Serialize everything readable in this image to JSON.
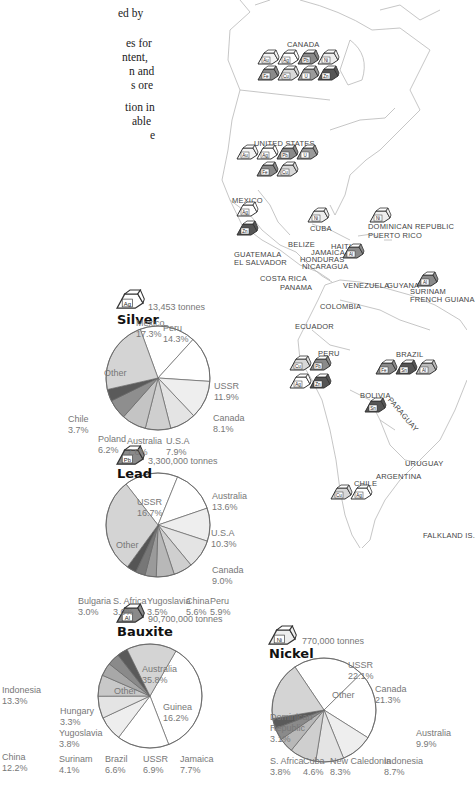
{
  "intro_fragments": [
    "ed by",
    "es for",
    "ntent,",
    "n and",
    "s ore",
    "tion in",
    "able",
    "e"
  ],
  "map": {
    "country_labels": [
      {
        "id": "canada",
        "text": "CANADA",
        "x": 287,
        "y": 40
      },
      {
        "id": "us",
        "text": "UNITED STATES",
        "x": 254,
        "y": 139
      },
      {
        "id": "mexico",
        "text": "MEXICO",
        "x": 232,
        "y": 196
      },
      {
        "id": "cuba",
        "text": "CUBA",
        "x": 310,
        "y": 224
      },
      {
        "id": "dominican",
        "text": "DOMINICAN REPUBLIC",
        "x": 368,
        "y": 224
      },
      {
        "id": "puertorico",
        "text": "PUERTO RICO",
        "x": 368,
        "y": 232
      },
      {
        "id": "belize",
        "text": "BELIZE",
        "x": 288,
        "y": 241
      },
      {
        "id": "haiti",
        "text": "HAITI",
        "x": 331,
        "y": 245
      },
      {
        "id": "jamaica",
        "text": "JAMAICA",
        "x": 311,
        "y": 247
      },
      {
        "id": "honduras",
        "text": "HONDURAS",
        "x": 301,
        "y": 254
      },
      {
        "id": "guatemala",
        "text": "GUATEMALA",
        "x": 234,
        "y": 250
      },
      {
        "id": "elsalvador",
        "text": "EL SALVADOR",
        "x": 234,
        "y": 257
      },
      {
        "id": "nicaragua",
        "text": "NICARAGUA",
        "x": 302,
        "y": 261
      },
      {
        "id": "costarica",
        "text": "COSTA RICA",
        "x": 260,
        "y": 276
      },
      {
        "id": "panama",
        "text": "PANAMA",
        "x": 280,
        "y": 284
      },
      {
        "id": "venezuela",
        "text": "VENEZUELA",
        "x": 345,
        "y": 284
      },
      {
        "id": "guyana",
        "text": "GUYANA",
        "x": 388,
        "y": 284
      },
      {
        "id": "suriname",
        "text": "SURINAM",
        "x": 410,
        "y": 290
      },
      {
        "id": "frenchguiana",
        "text": "FRENCH GUIANA",
        "x": 410,
        "y": 298
      },
      {
        "id": "colombia",
        "text": "COLOMBIA",
        "x": 322,
        "y": 302
      },
      {
        "id": "ecuador",
        "text": "ECUADOR",
        "x": 296,
        "y": 324
      },
      {
        "id": "peru",
        "text": "PERU",
        "x": 318,
        "y": 350
      },
      {
        "id": "brazil",
        "text": "BRAZIL",
        "x": 396,
        "y": 354
      },
      {
        "id": "bolivia",
        "text": "BOLIVIA",
        "x": 360,
        "y": 392
      },
      {
        "id": "paraguay",
        "text": "PARAGUAY",
        "x": 384,
        "y": 410
      },
      {
        "id": "uruguay",
        "text": "URUGUAY",
        "x": 405,
        "y": 460
      },
      {
        "id": "argentina",
        "text": "ARGENTINA",
        "x": 376,
        "y": 472
      },
      {
        "id": "chile",
        "text": "CHILE",
        "x": 354,
        "y": 479
      },
      {
        "id": "falkland",
        "text": "FALKLAND IS.",
        "x": 423,
        "y": 532
      }
    ],
    "mineral_blocks": [
      {
        "country": "Canada",
        "symbol": "Au",
        "shade": "#f4f4f4",
        "x": 258,
        "y": 50
      },
      {
        "country": "Canada",
        "symbol": "Ag",
        "shade": "#ffffff",
        "x": 278,
        "y": 50
      },
      {
        "country": "Canada",
        "symbol": "Pb",
        "shade": "#8a8a8a",
        "x": 298,
        "y": 50
      },
      {
        "country": "Canada",
        "symbol": "Ni",
        "shade": "#eeeeee",
        "x": 318,
        "y": 50
      },
      {
        "country": "Canada",
        "symbol": "Fe",
        "shade": "#8a8a8a",
        "x": 258,
        "y": 66
      },
      {
        "country": "Canada",
        "symbol": "Cu",
        "shade": "#d8d8d8",
        "x": 278,
        "y": 66
      },
      {
        "country": "Canada",
        "symbol": "U",
        "shade": "#9a9a9a",
        "x": 298,
        "y": 66
      },
      {
        "country": "Canada",
        "symbol": "Zn",
        "shade": "#555555",
        "x": 318,
        "y": 66
      },
      {
        "country": "United States",
        "symbol": "Au",
        "shade": "#f4f4f4",
        "x": 237,
        "y": 145
      },
      {
        "country": "United States",
        "symbol": "Ag",
        "shade": "#ffffff",
        "x": 257,
        "y": 145
      },
      {
        "country": "United States",
        "symbol": "Pb",
        "shade": "#8a8a8a",
        "x": 277,
        "y": 145
      },
      {
        "country": "United States",
        "symbol": "U",
        "shade": "#9a9a9a",
        "x": 297,
        "y": 145
      },
      {
        "country": "United States",
        "symbol": "Fe",
        "shade": "#8a8a8a",
        "x": 257,
        "y": 162
      },
      {
        "country": "United States",
        "symbol": "Cu",
        "shade": "#d8d8d8",
        "x": 277,
        "y": 162
      },
      {
        "country": "Mexico",
        "symbol": "Ag",
        "shade": "#ffffff",
        "x": 237,
        "y": 202
      },
      {
        "country": "Mexico",
        "symbol": "Zn",
        "shade": "#555555",
        "x": 237,
        "y": 221
      },
      {
        "country": "Cuba",
        "symbol": "Ni",
        "shade": "#eeeeee",
        "x": 308,
        "y": 208
      },
      {
        "country": "Dominican Republic",
        "symbol": "Ni",
        "shade": "#eeeeee",
        "x": 370,
        "y": 208
      },
      {
        "country": "Jamaica",
        "symbol": "Al",
        "shade": "#8a8a8a",
        "x": 343,
        "y": 244
      },
      {
        "country": "Surinam",
        "symbol": "Al",
        "shade": "#8a8a8a",
        "x": 417,
        "y": 272
      },
      {
        "country": "Peru",
        "symbol": "Cu",
        "shade": "#d8d8d8",
        "x": 290,
        "y": 356
      },
      {
        "country": "Peru",
        "symbol": "Pb",
        "shade": "#8a8a8a",
        "x": 310,
        "y": 356
      },
      {
        "country": "Peru",
        "symbol": "Ag",
        "shade": "#ffffff",
        "x": 290,
        "y": 374
      },
      {
        "country": "Peru",
        "symbol": "Zn",
        "shade": "#555555",
        "x": 310,
        "y": 374
      },
      {
        "country": "Brazil",
        "symbol": "Fe",
        "shade": "#8a8a8a",
        "x": 376,
        "y": 360
      },
      {
        "country": "Brazil",
        "symbol": "Sn",
        "shade": "#555555",
        "x": 396,
        "y": 360
      },
      {
        "country": "Brazil",
        "symbol": "Al",
        "shade": "#bbbbbb",
        "x": 416,
        "y": 360
      },
      {
        "country": "Bolivia",
        "symbol": "Sn",
        "shade": "#555555",
        "x": 365,
        "y": 398
      },
      {
        "country": "Chile",
        "symbol": "Cu",
        "shade": "#d8d8d8",
        "x": 331,
        "y": 485
      },
      {
        "country": "Chile",
        "symbol": "Ag",
        "shade": "#ffffff",
        "x": 351,
        "y": 485
      }
    ]
  },
  "chart_data": [
    {
      "type": "pie",
      "title": "Silver",
      "symbol": "Ag",
      "subtitle": "13,453 tonnes",
      "categories": [
        "Mexico",
        "Peru",
        "USSR",
        "Canada",
        "U.S.A",
        "Australia",
        "Poland",
        "Chile",
        "Other"
      ],
      "values": [
        17.3,
        14.3,
        11.9,
        8.1,
        7.9,
        7.6,
        6.2,
        3.7,
        23.0
      ],
      "labels": [
        "17.3%",
        "14.3%",
        "11.9%",
        "8.1%",
        "7.9%",
        "7.6%",
        "6.2%",
        "3.7%",
        ""
      ]
    },
    {
      "type": "pie",
      "title": "Lead",
      "symbol": "Pb",
      "subtitle": "3,300,000 tonnes",
      "categories": [
        "USSR",
        "Australia",
        "U.S.A",
        "Canada",
        "Peru",
        "China",
        "Yugoslavia",
        "S. Africa",
        "Bulgaria",
        "Other"
      ],
      "values": [
        16.7,
        13.6,
        10.3,
        9.0,
        5.9,
        5.6,
        3.5,
        3.0,
        3.0,
        29.4
      ],
      "labels": [
        "16.7%",
        "13.6%",
        "10.3%",
        "9.0%",
        "5.9%",
        "5.6%",
        "3.5%",
        "3.0%",
        "3.0%",
        ""
      ]
    },
    {
      "type": "pie",
      "title": "Bauxite",
      "symbol": "Al",
      "subtitle": "90,700,000 tonnes",
      "categories": [
        "Australia",
        "Guinea",
        "Jamaica",
        "USSR",
        "Brazil",
        "Surinam",
        "Yugoslavia",
        "Hungary",
        "Other"
      ],
      "values": [
        35.8,
        16.2,
        7.7,
        6.9,
        6.6,
        4.1,
        3.8,
        3.3,
        15.6
      ],
      "labels": [
        "35.8%",
        "16.2%",
        "7.7%",
        "6.9%",
        "6.6%",
        "4.1%",
        "3.8%",
        "3.3%",
        ""
      ]
    },
    {
      "type": "pie",
      "title": "Nickel",
      "symbol": "Ni",
      "subtitle": "770,000 tonnes",
      "categories": [
        "USSR",
        "Canada",
        "Australia",
        "Indonesia",
        "New Caledonia",
        "Cuba",
        "S. Africa",
        "Dominican Republic",
        "Other"
      ],
      "values": [
        22.1,
        21.3,
        9.9,
        8.7,
        8.3,
        4.6,
        3.8,
        3.1,
        18.2
      ],
      "labels": [
        "22.1%",
        "21.3%",
        "9.9%",
        "8.7%",
        "8.3%",
        "4.6%",
        "3.8%",
        "3.1%",
        ""
      ]
    },
    {
      "type": "pie",
      "title": "(partial, cropped)",
      "categories": [
        "Indonesia",
        "China"
      ],
      "values": [
        13.3,
        12.2
      ],
      "labels": [
        "13.3%",
        "12.2%"
      ]
    }
  ],
  "pies": {
    "silver": {
      "title": "Silver",
      "symbol": "Ag",
      "tonnes": "13,453 tonnes",
      "labels": [
        {
          "text": "Mexico\n17.3%",
          "x": 136,
          "y": 318
        },
        {
          "text": "Peru\n14.3%",
          "x": 163,
          "y": 323
        },
        {
          "text": "USSR\n11.9%",
          "x": 214,
          "y": 381
        },
        {
          "text": "Canada\n8.1%",
          "x": 213,
          "y": 413
        },
        {
          "text": "U.S.A\n7.9%",
          "x": 166,
          "y": 436
        },
        {
          "text": "Australia\n7.6%",
          "x": 127,
          "y": 436
        },
        {
          "text": "Poland\n6.2%",
          "x": 98,
          "y": 434
        },
        {
          "text": "Chile\n3.7%",
          "x": 68,
          "y": 414
        },
        {
          "text": "Other",
          "x": 104,
          "y": 368
        }
      ]
    },
    "lead": {
      "title": "Lead",
      "symbol": "Pb",
      "tonnes": "3,300,000 tonnes",
      "labels": [
        {
          "text": "USSR\n16.7%",
          "x": 137,
          "y": 497
        },
        {
          "text": "Australia\n13.6%",
          "x": 212,
          "y": 491
        },
        {
          "text": "U.S.A\n10.3%",
          "x": 211,
          "y": 528
        },
        {
          "text": "Canada\n9.0%",
          "x": 212,
          "y": 565
        },
        {
          "text": "Peru\n5.9%",
          "x": 210,
          "y": 596
        },
        {
          "text": "China\n5.6%",
          "x": 186,
          "y": 596
        },
        {
          "text": "Yugoslavia\n3.5%",
          "x": 147,
          "y": 596
        },
        {
          "text": "S. Africa\n3.0%",
          "x": 113,
          "y": 596
        },
        {
          "text": "Bulgaria\n3.0%",
          "x": 78,
          "y": 596
        },
        {
          "text": "Other",
          "x": 116,
          "y": 540
        }
      ]
    },
    "bauxite": {
      "title": "Bauxite",
      "symbol": "Al",
      "tonnes": "90,700,000 tonnes",
      "labels": [
        {
          "text": "Australia\n35.8%",
          "x": 142,
          "y": 664
        },
        {
          "text": "Guinea\n16.2%",
          "x": 163,
          "y": 702
        },
        {
          "text": "Jamaica\n7.7%",
          "x": 180,
          "y": 754
        },
        {
          "text": "USSR\n6.9%",
          "x": 143,
          "y": 754
        },
        {
          "text": "Brazil\n6.6%",
          "x": 105,
          "y": 754
        },
        {
          "text": "Surinam\n4.1%",
          "x": 59,
          "y": 754
        },
        {
          "text": "Yugoslavia\n3.8%",
          "x": 59,
          "y": 728
        },
        {
          "text": "Hungary\n3.3%",
          "x": 60,
          "y": 706
        },
        {
          "text": "Other",
          "x": 114,
          "y": 686
        }
      ]
    },
    "nickel": {
      "title": "Nickel",
      "symbol": "Ni",
      "tonnes": "770,000 tonnes",
      "labels": [
        {
          "text": "USSR\n22.1%",
          "x": 348,
          "y": 660
        },
        {
          "text": "Canada\n21.3%",
          "x": 375,
          "y": 684
        },
        {
          "text": "Australia\n9.9%",
          "x": 416,
          "y": 728
        },
        {
          "text": "Indonesia\n8.7%",
          "x": 384,
          "y": 756
        },
        {
          "text": "New Caledonia\n8.3%",
          "x": 330,
          "y": 756
        },
        {
          "text": "Cuba\n4.6%",
          "x": 303,
          "y": 756
        },
        {
          "text": "S. Africa\n3.8%",
          "x": 270,
          "y": 756
        },
        {
          "text": "Dominican\nRepublic\n3.1%",
          "x": 270,
          "y": 712
        },
        {
          "text": "Other",
          "x": 332,
          "y": 690
        }
      ]
    },
    "cropped": {
      "labels": [
        {
          "text": "Indonesia\n13.3%",
          "x": 2,
          "y": 685
        },
        {
          "text": "China\n12.2%",
          "x": 2,
          "y": 752
        }
      ]
    }
  },
  "colors": {
    "slice_white": "#ffffff",
    "slice_light": "#eeeeee",
    "slice_mid": "#cfcfcf",
    "slice_other": "#d4d4d4",
    "slice_dark": "#8a8a8a",
    "slice_darkest": "#5a5a5a",
    "outline": "#666666",
    "map_line": "#bbbbbb"
  }
}
